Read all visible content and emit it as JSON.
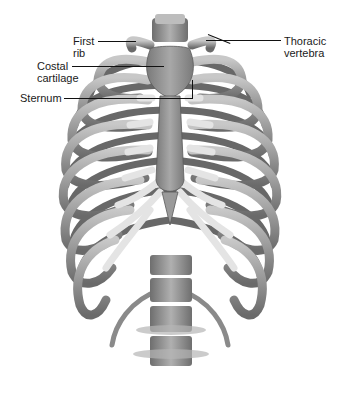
{
  "diagram": {
    "labels": {
      "first_rib": "First\nrib",
      "costal_cartilage": "Costal\ncartilage",
      "sternum": "Sternum",
      "thoracic_vertebra": "Thoracic\nvertebra"
    },
    "colors": {
      "bone_light": "#d6d6d6",
      "bone_mid": "#9a9a9a",
      "bone_dark": "#5e5e5e",
      "cartilage": "#e9e9e9",
      "leader": "#111111",
      "background": "#ffffff"
    }
  }
}
